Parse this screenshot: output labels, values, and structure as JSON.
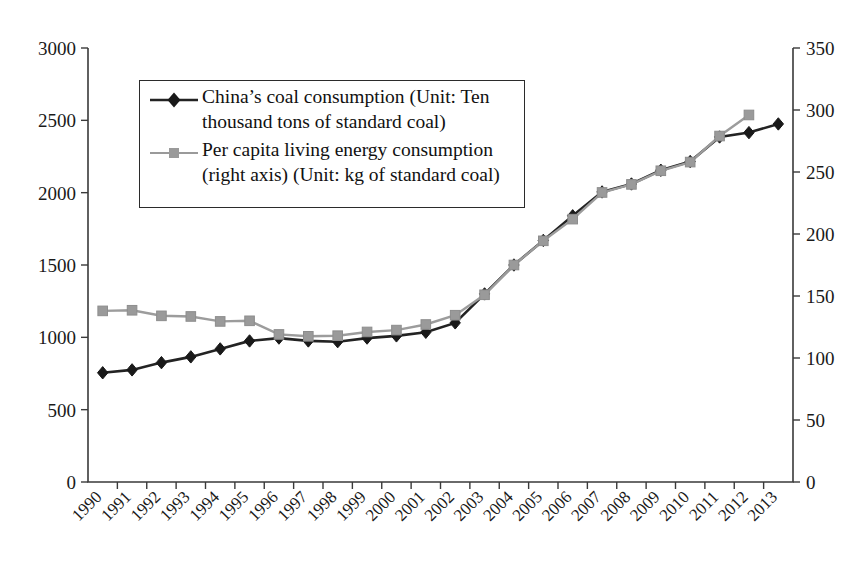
{
  "chart_data": {
    "type": "line",
    "title": "",
    "xlabel": "",
    "ylabel": "",
    "grid": false,
    "legend_position": "upper-left-inside",
    "categories": [
      "1990",
      "1991",
      "1992",
      "1993",
      "1994",
      "1995",
      "1996",
      "1997",
      "1998",
      "1999",
      "2000",
      "2001",
      "2002",
      "2003",
      "2004",
      "2005",
      "2006",
      "2007",
      "2008",
      "2009",
      "2010",
      "2011",
      "2012",
      "2013"
    ],
    "axes": {
      "left": {
        "label": "",
        "min": 0,
        "max": 3000,
        "step": 500,
        "ticks": [
          "0",
          "500",
          "1000",
          "1500",
          "2000",
          "2500",
          "3000"
        ]
      },
      "right": {
        "label": "",
        "min": 0,
        "max": 350,
        "step": 50,
        "ticks": [
          "0",
          "50",
          "100",
          "150",
          "200",
          "250",
          "300",
          "350"
        ]
      }
    },
    "series": [
      {
        "name": "China's coal consumption (Unit: Ten thousand tons of standard coal)",
        "legend_label_line1": "China’s coal consumption (Unit: Ten",
        "legend_label_line2": "thousand tons of standard coal)",
        "axis": "left",
        "color": "#232323",
        "marker": "diamond",
        "values": [
          755,
          775,
          825,
          865,
          920,
          975,
          995,
          975,
          970,
          995,
          1010,
          1035,
          1100,
          1300,
          1500,
          1670,
          1840,
          2005,
          2060,
          2155,
          2215,
          2385,
          2415,
          2475
        ]
      },
      {
        "name": "Per capita living energy consumption (right axis) (Unit: kg of standard coal)",
        "legend_label_line1": "Per capita living energy consumption",
        "legend_label_line2": "(right axis) (Unit: kg of standard coal)",
        "axis": "right",
        "color": "#9a9a9a",
        "marker": "square",
        "values": [
          138,
          138.5,
          134,
          133.5,
          129.5,
          130,
          119,
          117.5,
          118,
          121,
          122.5,
          127,
          134.5,
          151,
          175,
          194.5,
          212,
          233.5,
          240,
          251,
          258,
          279,
          296,
          null
        ]
      }
    ]
  }
}
